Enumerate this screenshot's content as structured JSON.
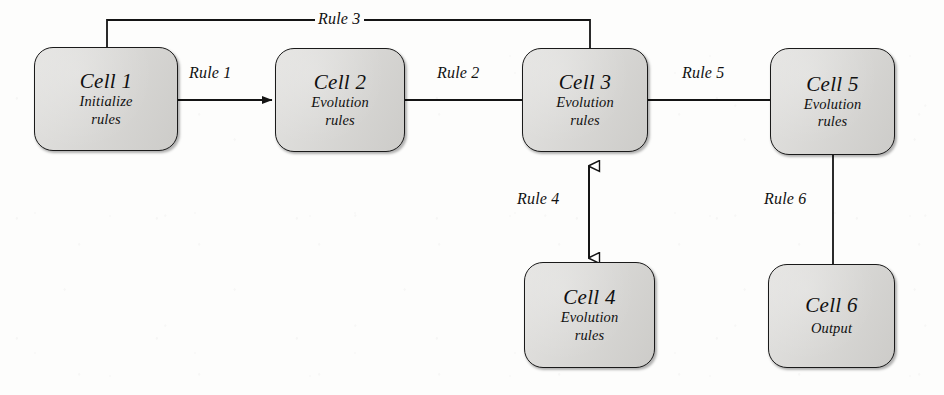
{
  "diagram": {
    "type": "flow-diagram",
    "canvas": {
      "width": 944,
      "height": 395
    },
    "style": {
      "node_fill": "#d6d5d2",
      "node_stroke": "#1a1a1a",
      "edge_stroke": "#141414",
      "background": "#fdfdfc"
    },
    "nodes": [
      {
        "id": "cell1",
        "title": "Cell 1",
        "subtitle": "Initialize\nrules",
        "sub_line1": "Initialize",
        "sub_line2": "rules",
        "x": 34,
        "y": 47,
        "w": 144,
        "h": 104
      },
      {
        "id": "cell2",
        "title": "Cell 2",
        "subtitle": "Evolution\nrules",
        "sub_line1": "Evolution",
        "sub_line2": "rules",
        "x": 275,
        "y": 48,
        "w": 130,
        "h": 104
      },
      {
        "id": "cell3",
        "title": "Cell 3",
        "subtitle": "Evolution\nrules",
        "sub_line1": "Evolution",
        "sub_line2": "rules",
        "x": 522,
        "y": 48,
        "w": 126,
        "h": 104
      },
      {
        "id": "cell4",
        "title": "Cell 4",
        "subtitle": "Evolution\nrules",
        "sub_line1": "Evolution",
        "sub_line2": "rules",
        "x": 524,
        "y": 262,
        "w": 131,
        "h": 106
      },
      {
        "id": "cell5",
        "title": "Cell 5",
        "subtitle": "Evolution\nrules",
        "sub_line1": "Evolution",
        "sub_line2": "rules",
        "x": 770,
        "y": 48,
        "w": 125,
        "h": 107
      },
      {
        "id": "cell6",
        "title": "Cell 6",
        "subtitle": "Output",
        "sub_line1": "Output",
        "sub_line2": "",
        "x": 768,
        "y": 264,
        "w": 127,
        "h": 104
      }
    ],
    "edges": [
      {
        "id": "rule1",
        "label": "Rule 1",
        "from": "cell1",
        "to": "cell2",
        "arrow": "filled-single",
        "direction": "right",
        "label_x": 189,
        "label_y": 64
      },
      {
        "id": "rule2",
        "label": "Rule 2",
        "from": "cell2",
        "to": "cell3",
        "arrow": "none",
        "direction": "right",
        "label_x": 437,
        "label_y": 64
      },
      {
        "id": "rule3",
        "label": "Rule 3",
        "from": "cell1",
        "to": "cell3",
        "arrow": "none",
        "direction": "top-bracket",
        "label_x": 315,
        "label_y": 10
      },
      {
        "id": "rule4",
        "label": "Rule 4",
        "from": "cell4",
        "to": "cell3",
        "arrow": "hollow-double",
        "direction": "vertical",
        "label_x": 517,
        "label_y": 190
      },
      {
        "id": "rule5",
        "label": "Rule 5",
        "from": "cell3",
        "to": "cell5",
        "arrow": "none",
        "direction": "right",
        "label_x": 682,
        "label_y": 64
      },
      {
        "id": "rule6",
        "label": "Rule 6",
        "from": "cell5",
        "to": "cell6",
        "arrow": "none",
        "direction": "vertical",
        "label_x": 764,
        "label_y": 190
      }
    ]
  }
}
